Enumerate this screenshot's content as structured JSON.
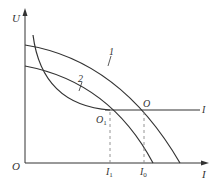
{
  "diagram": {
    "type": "U-I characteristic curves",
    "axes": {
      "y_label": "U",
      "x_label": "I",
      "origin_label": "O"
    },
    "curves": [
      {
        "label": "1"
      },
      {
        "label": "2"
      }
    ],
    "horizontal_line_label": "I",
    "points": [
      {
        "label": "O"
      },
      {
        "label": "O",
        "subscript": "1"
      }
    ],
    "x_ticks": [
      {
        "label": "I",
        "subscript": "1"
      },
      {
        "label": "I",
        "subscript": "0"
      }
    ],
    "colors": {
      "line": "#333333",
      "dashed": "#888888"
    }
  }
}
